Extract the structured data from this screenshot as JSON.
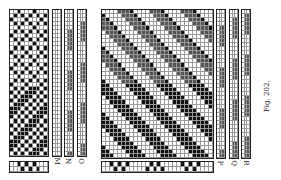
{
  "figure": {
    "caption": "Fig. 202.",
    "left_panel": {
      "strip_labels": [
        "M",
        "N",
        "O"
      ],
      "main_grid": {
        "cols": 10,
        "rows": 36,
        "upper_pattern": "checker-diamond",
        "lower_pattern": "diagonal-blocks"
      }
    },
    "right_panel": {
      "strip_labels": [
        "P",
        "Q",
        "R"
      ],
      "main_grid": {
        "cols": 28,
        "rows": 36,
        "upper_pattern": "diagonal-twill-hatched",
        "lower_pattern": "diagonal-twill-solid"
      }
    },
    "colors": {
      "ink": "#111111",
      "hatch": "#555555",
      "paper": "#ffffff",
      "line": "#999999"
    }
  }
}
